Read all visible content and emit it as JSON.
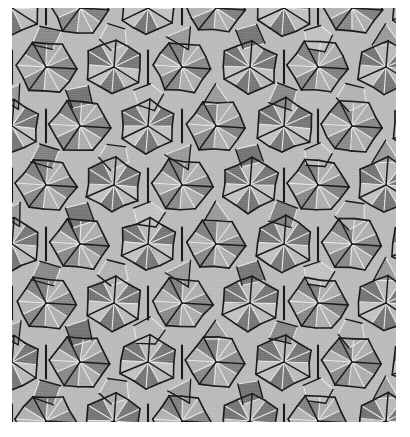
{
  "figure": {
    "kind": "geometric-tiling-image",
    "canvas": {
      "width": 410,
      "height": 437,
      "background": "#ffffff"
    },
    "plate": {
      "x": 12,
      "y": 8,
      "width": 384,
      "height": 414
    },
    "palette": {
      "light_tile": "#bcbcbc",
      "light_tile_alt": "#b0b0b0",
      "dark_tile": "#848484",
      "dark_tile_alt": "#7a7a7a",
      "mid_tile": "#9c9c9c",
      "edge_dark": "#1a1a1a",
      "edge_light": "#e8e8e8",
      "background": "#ffffff"
    },
    "lattice": {
      "type": "hexagonal",
      "period_x": 68,
      "period_y": 59,
      "row_offset_x": 34,
      "rosette_radius": 30,
      "rosette_arms": 6
    },
    "tile_shapes": [
      {
        "name": "triangle",
        "sides": 3,
        "fill": "light_tile"
      },
      {
        "name": "kite",
        "sides": 4,
        "fill": "dark_tile"
      },
      {
        "name": "rhombus",
        "sides": 4,
        "fill": "dark_tile_alt"
      },
      {
        "name": "pentagon",
        "sides": 5,
        "fill": "light_tile_alt"
      }
    ],
    "edge_style": {
      "dark_stroke_width": 1.6,
      "light_stroke_width": 1.1
    }
  }
}
